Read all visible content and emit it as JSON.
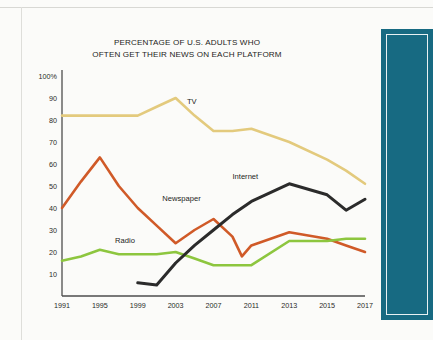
{
  "figure": {
    "title_line1": "PERCENTAGE OF U.S. ADULTS WHO",
    "title_line2": "OFTEN GET THEIR NEWS ON EACH PLATFORM"
  },
  "colors": {
    "tv": "#e3ca7d",
    "newspaper": "#d05a28",
    "radio": "#8dc63f",
    "internet": "#2b2b2b",
    "axis": "#4d4d4d",
    "side_panel": "#176a82"
  },
  "chart_data": {
    "type": "line",
    "title": "PERCENTAGE OF U.S. ADULTS WHO OFTEN GET THEIR NEWS ON EACH PLATFORM",
    "xlabel": "",
    "ylabel": "",
    "xlim": [
      1991,
      2017
    ],
    "ylim": [
      0,
      100
    ],
    "grid": false,
    "legend": "inline-labels",
    "xtick_labels": [
      "1991",
      "1995",
      "1999",
      "2003",
      "2007",
      "2011",
      "2013",
      "2015",
      "2017"
    ],
    "xtick_values": [
      1991,
      1995,
      1999,
      2003,
      2007,
      2011,
      2013,
      2015,
      2017
    ],
    "ytick_labels": [
      "100%",
      "90",
      "80",
      "70",
      "60",
      "50",
      "40",
      "30",
      "20",
      "10"
    ],
    "ytick_values": [
      100,
      90,
      80,
      70,
      60,
      50,
      40,
      30,
      20,
      10
    ],
    "series": [
      {
        "name": "TV",
        "color": "#e3ca7d",
        "label_x": 2004.2,
        "label_y": 88,
        "x": [
          1991,
          1993,
          1995,
          1997,
          1999,
          2001,
          2003,
          2005,
          2007,
          2009,
          2011,
          2013,
          2015,
          2016,
          2017
        ],
        "values": [
          82,
          82,
          82,
          82,
          82,
          86,
          90,
          82,
          75,
          75,
          76,
          70,
          62,
          57,
          51
        ]
      },
      {
        "name": "Newspaper",
        "color": "#d05a28",
        "label_x": 2001.6,
        "label_y": 44,
        "x": [
          1991,
          1993,
          1995,
          1997,
          1999,
          2001,
          2003,
          2005,
          2007,
          2009,
          2010,
          2011,
          2013,
          2015,
          2016,
          2017
        ],
        "values": [
          40,
          52,
          63,
          50,
          40,
          32,
          24,
          30,
          35,
          27,
          18,
          23,
          29,
          26,
          23,
          20
        ]
      },
      {
        "name": "Radio",
        "color": "#8dc63f",
        "label_x": 1996.6,
        "label_y": 25,
        "x": [
          1991,
          1993,
          1995,
          1997,
          1999,
          2001,
          2003,
          2005,
          2007,
          2009,
          2011,
          2013,
          2015,
          2016,
          2017
        ],
        "values": [
          16,
          18,
          21,
          19,
          19,
          19,
          20,
          17,
          14,
          14,
          14,
          25,
          25,
          26,
          26
        ]
      },
      {
        "name": "Internet",
        "color": "#2b2b2b",
        "label_x": 2009.0,
        "label_y": 54,
        "x": [
          1999,
          2001,
          2003,
          2005,
          2007,
          2009,
          2011,
          2013,
          2015,
          2016,
          2017
        ],
        "values": [
          6,
          5,
          15,
          23,
          30,
          37,
          43,
          51,
          46,
          39,
          44
        ]
      }
    ]
  }
}
